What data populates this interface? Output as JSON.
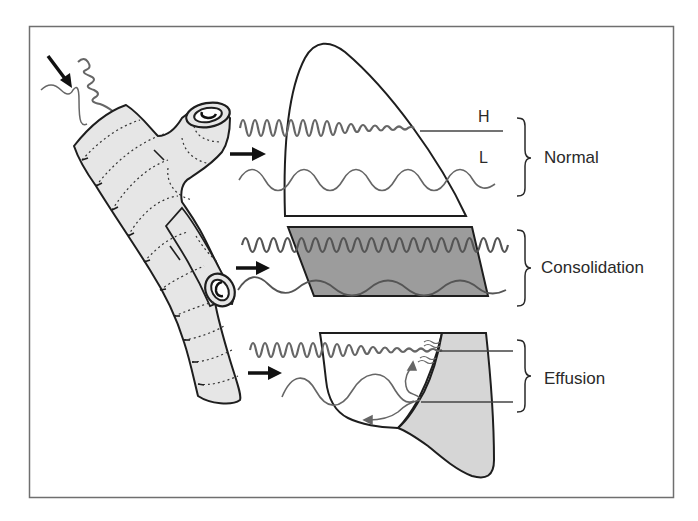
{
  "figure": {
    "colors": {
      "frame": "#6f6f6f",
      "outline": "#1e1e1e",
      "bronchus_fill": "#e6e6e6",
      "consolidation_fill": "#9c9c9c",
      "effusion_fill": "#d6d6d6",
      "wave": "#666666",
      "arrow": "#111111",
      "text": "#2a2a2a"
    },
    "wave_labels": {
      "high": "H",
      "low": "L"
    },
    "conditions": [
      {
        "id": "normal",
        "label": "Normal"
      },
      {
        "id": "consolidation",
        "label": "Consolidation"
      },
      {
        "id": "effusion",
        "label": "Effusion"
      }
    ]
  }
}
